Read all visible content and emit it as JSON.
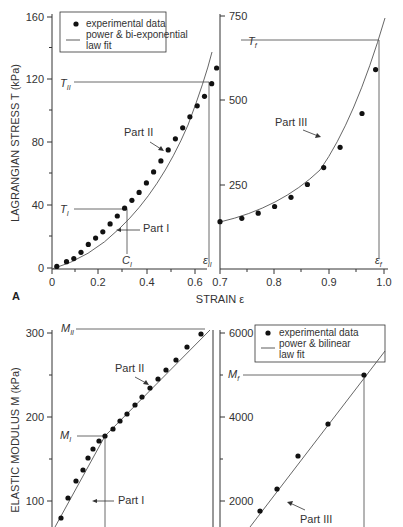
{
  "chart_data": [
    {
      "panel": "A",
      "type": "scatter",
      "title": "",
      "xlabel": "STRAIN ε",
      "ylabel": "LAGRANGIAN STRESS T (kPa)",
      "x_ticks_left": [
        "0",
        "0.2",
        "0.4",
        "0.6"
      ],
      "x_ticks_right": [
        "0.7",
        "0.8",
        "0.9",
        "1.0"
      ],
      "y_ticks_left": [
        "0",
        "40",
        "80",
        "120",
        "160"
      ],
      "y_ticks_right": [
        "250",
        "500",
        "750"
      ],
      "ylim_left": [
        0,
        160
      ],
      "ylim_right": [
        0,
        750
      ],
      "legend": {
        "position": "upper left",
        "entries": [
          "experimental data",
          "power & bi-exponential law fit"
        ]
      },
      "annotations": [
        "T_I",
        "T_II",
        "T_f",
        "C_I",
        "ε_II",
        "ε_f",
        "Part I",
        "Part II",
        "Part III"
      ],
      "series": [
        {
          "name": "experimental data (left axis)",
          "x": [
            0.02,
            0.06,
            0.09,
            0.12,
            0.15,
            0.18,
            0.21,
            0.24,
            0.27,
            0.3,
            0.33,
            0.36,
            0.39,
            0.42,
            0.45,
            0.48,
            0.51,
            0.54,
            0.57,
            0.6,
            0.63,
            0.66,
            0.68
          ],
          "y": [
            1,
            4,
            6,
            10,
            15,
            19,
            23,
            28,
            33,
            38,
            43,
            48,
            54,
            61,
            68,
            75,
            82,
            89,
            96,
            103,
            109,
            117,
            127
          ]
        },
        {
          "name": "experimental data (right axis)",
          "x": [
            0.7,
            0.74,
            0.77,
            0.8,
            0.83,
            0.86,
            0.89,
            0.92,
            0.96,
            0.985
          ],
          "y": [
            140,
            150,
            165,
            185,
            212,
            250,
            300,
            360,
            460,
            590
          ]
        }
      ]
    },
    {
      "panel": "B",
      "type": "scatter",
      "xlabel": "",
      "ylabel": "ELASTIC MODULUS M (kPa)",
      "y_ticks_left": [
        "100",
        "200",
        "300"
      ],
      "y_ticks_right": [
        "2000",
        "4000",
        "6000"
      ],
      "legend": {
        "position": "upper right",
        "entries": [
          "experimental data",
          "power & bilinear law fit"
        ]
      },
      "annotations": [
        "M_II",
        "M_I",
        "M_f",
        "Part I",
        "Part II",
        "Part III"
      ],
      "series": [
        {
          "name": "experimental data (left axis)",
          "y": [
            80,
            103,
            122,
            132,
            142,
            155,
            166,
            176,
            185,
            195,
            204,
            214,
            224,
            234,
            246,
            258,
            272,
            296
          ]
        },
        {
          "name": "experimental data (right axis)",
          "y": [
            1800,
            2200,
            2800,
            3700,
            4900
          ]
        }
      ]
    }
  ],
  "panelA": {
    "label": "A",
    "yticks_left": [
      {
        "v": "0",
        "y": 268
      },
      {
        "v": "40",
        "y": 205
      },
      {
        "v": "80",
        "y": 142
      },
      {
        "v": "120",
        "y": 79
      },
      {
        "v": "160",
        "y": 17
      }
    ],
    "yticks_right": [
      {
        "v": "250",
        "y": 185
      },
      {
        "v": "500",
        "y": 100
      },
      {
        "v": "750",
        "y": 16
      }
    ],
    "xticks_left": [
      {
        "v": "0",
        "x": 52
      },
      {
        "v": "0.2",
        "x": 98
      },
      {
        "v": "0.4",
        "x": 147
      },
      {
        "v": "0.6",
        "x": 195
      }
    ],
    "xticks_right": [
      {
        "v": "0.7",
        "x": 220
      },
      {
        "v": "0.8",
        "x": 274
      },
      {
        "v": "0.9",
        "x": 329
      },
      {
        "v": "1.0",
        "x": 384
      }
    ],
    "xlabel": "STRAIN ε",
    "ylabel": "LAGRANGIAN STRESS T (kPa)",
    "legend_data": "experimental data",
    "legend_fit1": "power & bi-exponential",
    "legend_fit2": "law fit",
    "T_I": "T",
    "T_I_sub": "I",
    "T_II": "T",
    "T_II_sub": "II",
    "T_f": "T",
    "T_f_sub": "f",
    "C_I": "C",
    "C_I_sub": "I",
    "eps_II": "ε",
    "eps_II_sub": "II",
    "eps_f": "ε",
    "eps_f_sub": "f",
    "part1": "Part I",
    "part2": "Part II",
    "part3": "Part III"
  },
  "panelB": {
    "yticks_left": [
      {
        "v": "300",
        "y": 333
      },
      {
        "v": "200",
        "y": 417
      },
      {
        "v": "100",
        "y": 501
      }
    ],
    "yticks_right": [
      {
        "v": "6000",
        "y": 333
      },
      {
        "v": "4000",
        "y": 417
      },
      {
        "v": "2000",
        "y": 501
      }
    ],
    "ylabel": "ELASTIC MODULUS M (kPa)",
    "legend_data": "experimental data",
    "legend_fit1": "power & bilinear",
    "legend_fit2": "law fit",
    "M_II": "M",
    "M_II_sub": "II",
    "M_I": "M",
    "M_I_sub": "I",
    "M_f": "M",
    "M_f_sub": "f",
    "part1": "Part I",
    "part2": "Part II",
    "part3": "Part III"
  }
}
